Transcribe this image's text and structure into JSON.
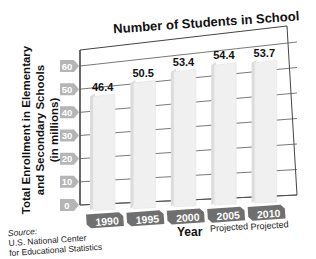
{
  "chart_data": {
    "type": "bar",
    "title": "Number of Students in School",
    "xlabel": "Year",
    "ylabel": [
      "Total Enrollment in Elementary",
      "and Secondary Schools",
      "(in millions)"
    ],
    "categories": [
      "1990",
      "1995",
      "2000",
      "2005",
      "2010"
    ],
    "category_notes": [
      "",
      "",
      "",
      "Projected",
      "Projected"
    ],
    "values": [
      46.4,
      50.5,
      53.4,
      54.4,
      53.7
    ],
    "value_labels": [
      "46.4",
      "50.5",
      "53.4",
      "54.4",
      "53.7"
    ],
    "yticks": [
      "0",
      "10",
      "20",
      "30",
      "40",
      "50",
      "60"
    ],
    "ylim": [
      0,
      60
    ],
    "grid": true,
    "style": "3d-perspective"
  },
  "source": {
    "label": "Source:",
    "lines": [
      "U.S. National Center",
      "for Educational Statistics"
    ]
  },
  "colors": {
    "tick_tag": "#b5b5b5",
    "category_tag": "#6f6f6f",
    "bar_face": "#f0f0f0",
    "bar_side": "#dcdcdc",
    "grid": "#555555"
  }
}
